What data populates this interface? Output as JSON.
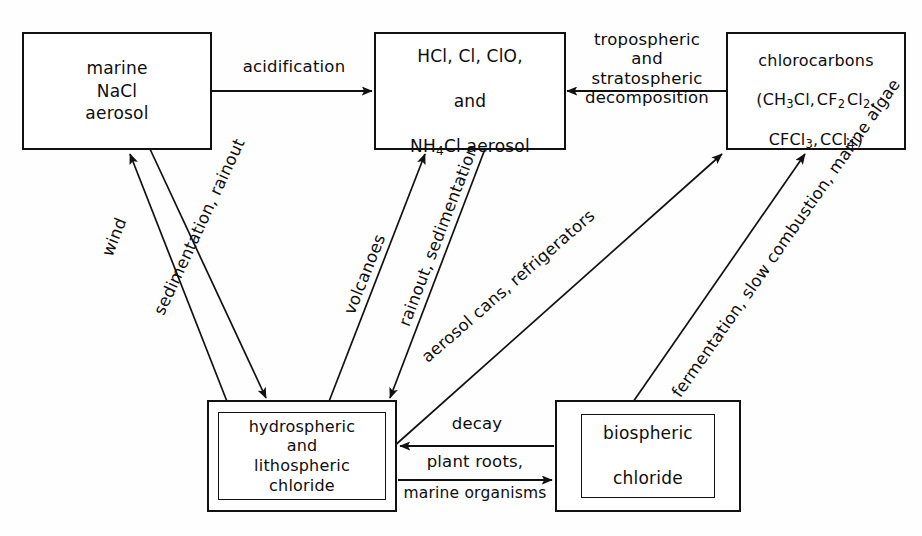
{
  "diagram": {
    "background": "#fefefe",
    "line_color": "#111111",
    "text_color": "#0d0d0d",
    "nodes": [
      {
        "id": "marine",
        "name": "marine-nacl-aerosol-box",
        "label": "marine\nNaCl\naerosol",
        "double_border": false
      },
      {
        "id": "hcl",
        "name": "hcl-cl-clo-nh4cl-aerosol-box",
        "label_line1": "HCl, Cl, ClO,",
        "label_line2": "and",
        "label_line3_pre": "NH",
        "label_line3_sub": "4",
        "label_line3_post": "Cl aerosol",
        "double_border": false
      },
      {
        "id": "chlorocarbons",
        "name": "chlorocarbons-box",
        "label_line1": "chlorocarbons",
        "label_line2": "(CH3Cl, CF2 Cl2,",
        "label_line3": "CFCl3, CCl4 )",
        "double_border": false
      },
      {
        "id": "hydro",
        "name": "hydrospheric-lithospheric-chloride-box",
        "label": "hydrospheric\nand\nlithospheric\nchloride",
        "double_border": true
      },
      {
        "id": "bio",
        "name": "biospheric-chloride-box",
        "label": "biospheric\n\nchloride",
        "double_border": true
      }
    ],
    "edge_labels": {
      "acidification": "acidification",
      "tropospheric_decomposition": "tropospheric\nand\nstratospheric\ndecomposition",
      "wind": "wind",
      "sedimentation_rainout": "sedimentation,\nrainout",
      "volcanoes": "volcanoes",
      "rainout_sedimentation": "rainout,\nsedimentation",
      "aerosol_cans": "aerosol cans, refrigerators",
      "fermentation": "fermentation,\nslow combustion,\nmarine algae",
      "decay": "decay",
      "plant_roots": "plant roots,",
      "marine_organisms": "marine organisms"
    }
  }
}
